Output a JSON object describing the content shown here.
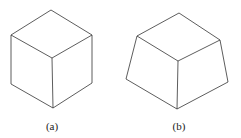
{
  "figures": [
    {
      "label": "(a)",
      "shape": "cube"
    },
    {
      "label": "(b)",
      "shape": "truncated-pyramid"
    }
  ]
}
